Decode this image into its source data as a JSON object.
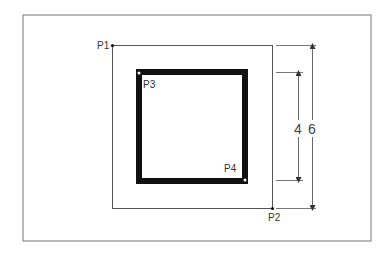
{
  "diagram": {
    "points": [
      {
        "id": "P1",
        "label": "P1"
      },
      {
        "id": "P2",
        "label": "P2"
      },
      {
        "id": "P3",
        "label": "P3"
      },
      {
        "id": "P4",
        "label": "P4"
      }
    ],
    "dimensions": [
      {
        "id": "inner",
        "label": "4"
      },
      {
        "id": "outer",
        "label": "6"
      }
    ],
    "colors": {
      "frame": "#8a8a8a",
      "thin_line": "#555555",
      "thick_square": "#111111",
      "background": "#ffffff"
    }
  }
}
